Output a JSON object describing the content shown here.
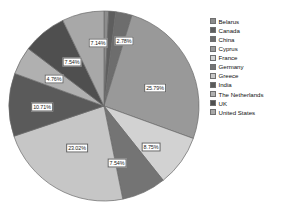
{
  "chart_data": {
    "type": "pie",
    "title": "",
    "categories": [
      "Belarus",
      "Canada",
      "China",
      "Cyprus",
      "France",
      "Germany",
      "Greece",
      "India",
      "The Netherlands",
      "UK",
      "United States"
    ],
    "values": [
      0.79,
      1.19,
      2.78,
      25.79,
      8.75,
      7.54,
      23.02,
      10.71,
      4.76,
      7.54,
      7.14
    ],
    "value_labels": [
      "",
      "",
      "2.78%",
      "25.79%",
      "8.75%",
      "7.54%",
      "23.02%",
      "10.71%",
      "4.76%",
      "7.54%",
      "7.14%"
    ],
    "colors": [
      "#8c8c8c",
      "#5e5e5e",
      "#6d6d6d",
      "#999999",
      "#d2d2d2",
      "#747474",
      "#c6c6c6",
      "#5a5a5a",
      "#b0b0b0",
      "#4f4f4f",
      "#a8a8a8"
    ],
    "unit": "%",
    "legend_position": "right",
    "start_angle": 0,
    "direction": "clockwise",
    "grid": false
  },
  "legend": {
    "items": [
      {
        "label": "Belarus"
      },
      {
        "label": "Canada"
      },
      {
        "label": "China"
      },
      {
        "label": "Cyprus"
      },
      {
        "label": "France"
      },
      {
        "label": "Germany"
      },
      {
        "label": "Greece"
      },
      {
        "label": "India"
      },
      {
        "label": "The Netherlands"
      },
      {
        "label": "UK"
      },
      {
        "label": "United States"
      }
    ]
  },
  "labels": {
    "china": "2.78%",
    "cyprus": "25.79%",
    "france": "8.75%",
    "germany": "7.54%",
    "greece": "23.02%",
    "india": "10.71%",
    "netherlands": "4.76%",
    "uk": "7.54%",
    "united_states": "7.14%"
  }
}
